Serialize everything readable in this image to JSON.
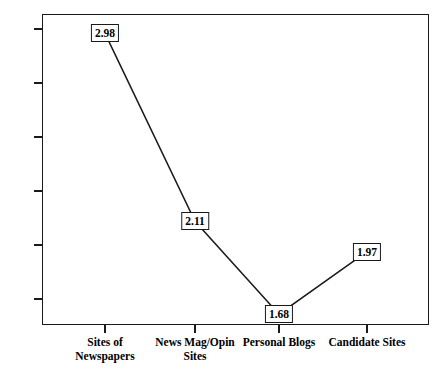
{
  "chart_data": {
    "type": "line",
    "title": "",
    "subtitle": "",
    "xlabel": "",
    "ylabel": "",
    "categories": [
      "Sites of\nNewspapers",
      "News Mag/Opin\nSites",
      "Personal Blogs",
      "Candidate Sites"
    ],
    "values": [
      2.98,
      2.11,
      1.68,
      1.97
    ],
    "point_labels": [
      "2.98",
      "2.11",
      "1.68",
      "1.97"
    ],
    "series": [
      {
        "name": "",
        "values": [
          2.98,
          2.11,
          1.68,
          1.97
        ]
      }
    ],
    "ylim": [
      1.63,
      3.07
    ],
    "yticks": [
      3,
      2.75,
      2.5,
      2.25,
      2,
      1.75
    ],
    "ytick_labels": [
      "3",
      "2.75",
      "2.5",
      "2.25",
      "2",
      "1.75"
    ],
    "grid": false,
    "legend": false,
    "legend_position": "none",
    "line_color": "#1a1a1a",
    "frame_color": "#1a1a1a",
    "background_color": "#ffffff",
    "label_box_fill": "#ffffff",
    "label_box_border": "#1a1a1a"
  },
  "axes": {
    "y_ticks": [
      {
        "label": "3",
        "value": 3
      },
      {
        "label": "2.75",
        "value": 2.75
      },
      {
        "label": "2.5",
        "value": 2.5
      },
      {
        "label": "2.25",
        "value": 2.25
      },
      {
        "label": "2",
        "value": 2
      },
      {
        "label": "1.75",
        "value": 1.75
      }
    ],
    "x_ticks": [
      {
        "label": "Sites of\nNewspapers"
      },
      {
        "label": "News Mag/Opin\nSites"
      },
      {
        "label": "Personal Blogs"
      },
      {
        "label": "Candidate Sites"
      }
    ]
  }
}
